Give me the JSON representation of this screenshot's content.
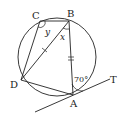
{
  "diagram": {
    "points": {
      "C": {
        "label": "C",
        "x": 40,
        "y": 21
      },
      "B": {
        "label": "B",
        "x": 69,
        "y": 21
      },
      "D": {
        "label": "D",
        "x": 21,
        "y": 80
      },
      "A": {
        "label": "A",
        "x": 73,
        "y": 95
      },
      "T": {
        "label": "T",
        "x": 113,
        "y": 80
      }
    },
    "circle": {
      "cx": 57,
      "cy": 57,
      "r": 39
    },
    "angles": {
      "y_label": "y",
      "x_label": "x",
      "given_label": "70°"
    },
    "colors": {
      "stroke": "#222222",
      "background": "#ffffff"
    }
  }
}
